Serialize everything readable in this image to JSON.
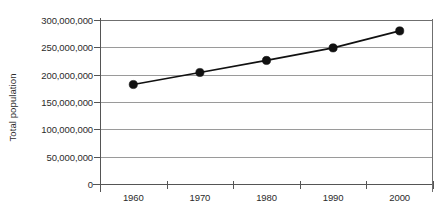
{
  "chart_data": {
    "type": "line",
    "title": "",
    "xlabel": "",
    "ylabel": "Total population",
    "categories": [
      "1960",
      "1970",
      "1980",
      "1990",
      "2000"
    ],
    "x": [
      1960,
      1970,
      1980,
      1990,
      2000
    ],
    "values": [
      182000000,
      204000000,
      226000000,
      249000000,
      280000000
    ],
    "series": [
      {
        "name": "Total population",
        "values": [
          182000000,
          204000000,
          226000000,
          249000000,
          280000000
        ]
      }
    ],
    "ylim": [
      0,
      300000000
    ],
    "ytick_values": [
      0,
      50000000,
      100000000,
      150000000,
      200000000,
      250000000,
      300000000
    ],
    "ytick_labels": [
      "0",
      "50,000,000",
      "100,000,000",
      "150,000,000",
      "200,000,000",
      "250,000,000",
      "300,000,000"
    ],
    "xtick_labels": [
      "1960",
      "1970",
      "1980",
      "1990",
      "2000"
    ],
    "grid": "horizontal",
    "legend": "none",
    "marker": "filled-circle",
    "line_color": "#111111",
    "marker_color": "#111111",
    "gridline_color": "#9a9a9a",
    "axis_color": "#555555",
    "text_color": "#2b2b2b",
    "background_color": "#ffffff"
  }
}
